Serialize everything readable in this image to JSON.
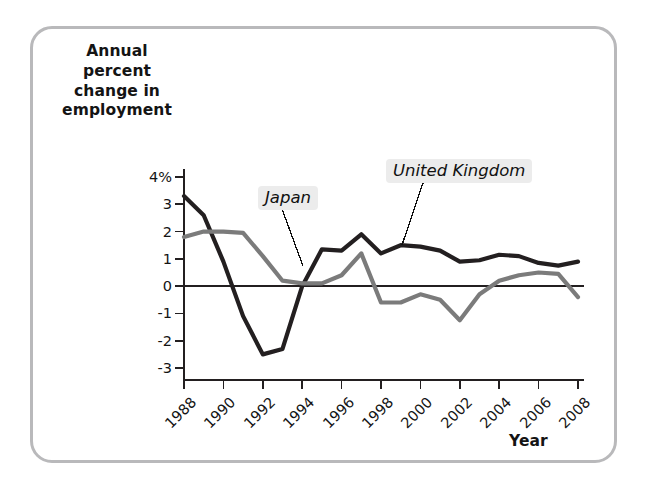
{
  "chart_data": {
    "type": "line",
    "title": "",
    "xlabel": "Year",
    "ylabel": "Annual percent change in employment",
    "x": [
      1988,
      1989,
      1990,
      1991,
      1992,
      1993,
      1994,
      1995,
      1996,
      1997,
      1998,
      1999,
      2000,
      2001,
      2002,
      2003,
      2004,
      2005,
      2006,
      2007,
      2008
    ],
    "xlim": [
      1988,
      2008
    ],
    "ylim": [
      -3,
      4
    ],
    "yticks": [
      4,
      3,
      2,
      1,
      0,
      -1,
      -2,
      -3
    ],
    "ytick_labels": [
      "4%",
      "3",
      "2",
      "1",
      "0",
      "-1",
      "-2",
      "-3"
    ],
    "xticks": [
      1988,
      1990,
      1992,
      1994,
      1996,
      1998,
      2000,
      2002,
      2004,
      2006,
      2008
    ],
    "xtick_labels": [
      "1988",
      "1990",
      "1992",
      "1994",
      "1996",
      "1998",
      "2000",
      "2002",
      "2004",
      "2006",
      "2008"
    ],
    "grid": false,
    "legend_position": "inline-annotations",
    "zero_line": true,
    "series": [
      {
        "name": "United Kingdom",
        "color": "#231f20",
        "values": [
          3.3,
          2.6,
          0.9,
          -1.1,
          -2.5,
          -2.3,
          0.0,
          1.35,
          1.3,
          1.9,
          1.2,
          1.5,
          1.45,
          1.3,
          0.9,
          0.95,
          1.15,
          1.1,
          0.85,
          0.75,
          0.9
        ]
      },
      {
        "name": "Japan",
        "color": "#7b7b7b",
        "values": [
          1.8,
          2.0,
          2.0,
          1.95,
          1.1,
          0.2,
          0.1,
          0.1,
          0.4,
          1.2,
          -0.6,
          -0.6,
          -0.3,
          -0.5,
          -1.25,
          -0.3,
          0.2,
          0.4,
          0.5,
          0.45,
          -0.4
        ]
      }
    ],
    "annotations": [
      {
        "label": "Japan",
        "series": "Japan"
      },
      {
        "label": "United Kingdom",
        "series": "United Kingdom"
      }
    ]
  },
  "axes": {
    "y_title": "Annual\npercent\nchange in\nemployment",
    "x_title": "Year"
  },
  "colors": {
    "frame_border": "#b9b9bb",
    "axis": "#231f20",
    "uk_line": "#231f20",
    "japan_line": "#7b7b7b",
    "annotation_background": "#ececec"
  }
}
